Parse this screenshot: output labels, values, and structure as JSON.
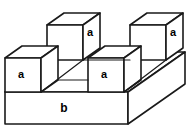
{
  "figure": {
    "background_color": "#ffffff",
    "line_color": "#1a1a1a",
    "face_color": "#ffffff",
    "label_color": "#000000"
  },
  "labels": {
    "cube_back_left": "a",
    "cube_back_right": "a",
    "cube_front_left": "a",
    "cube_front_right": "a",
    "base_slab": "b"
  },
  "diagram_data": {
    "type": "isometric-solid-diagram",
    "parts": [
      {
        "name": "base-slab",
        "label": "b",
        "shape": "rectangular-slab",
        "count": 1
      },
      {
        "name": "cube-back-left",
        "label": "a",
        "shape": "cube",
        "row": "back",
        "column": "left"
      },
      {
        "name": "cube-back-right",
        "label": "a",
        "shape": "cube",
        "row": "back",
        "column": "right"
      },
      {
        "name": "cube-front-left",
        "label": "a",
        "shape": "cube",
        "row": "front",
        "column": "left"
      },
      {
        "name": "cube-front-right",
        "label": "a",
        "shape": "cube",
        "row": "front",
        "column": "right"
      }
    ],
    "cube_count": 4,
    "slab_count": 1,
    "arrangement": "checkerboard: two cubes in the back row and two cubes in the front row, offset"
  }
}
